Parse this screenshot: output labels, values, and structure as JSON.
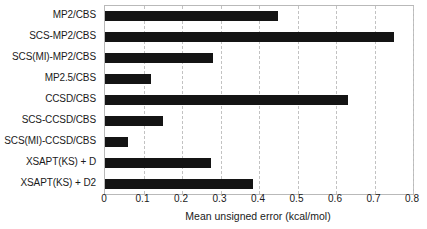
{
  "chart_data": {
    "type": "bar",
    "orientation": "horizontal",
    "title": "",
    "xlabel": "Mean unsigned error (kcal/mol)",
    "ylabel": "",
    "xlim": [
      0,
      0.8
    ],
    "xticks": [
      "0",
      "0.1",
      "0.2",
      "0.3",
      "0.4",
      "0.5",
      "0.6",
      "0.7",
      "0.8"
    ],
    "xtick_values": [
      0,
      0.1,
      0.2,
      0.3,
      0.4,
      0.5,
      0.6,
      0.7,
      0.8
    ],
    "grid": "vertical-dashed",
    "legend": "none",
    "bar_color": "#141414",
    "categories": [
      "MP2/CBS",
      "SCS-MP2/CBS",
      "SCS(MI)-MP2/CBS",
      "MP2.5/CBS",
      "CCSD/CBS",
      "SCS-CCSD/CBS",
      "SCS(MI)-CCSD/CBS",
      "XSAPT(KS) + D",
      "XSAPT(KS) + D2"
    ],
    "values": [
      0.45,
      0.75,
      0.28,
      0.12,
      0.63,
      0.15,
      0.06,
      0.275,
      0.385
    ]
  }
}
